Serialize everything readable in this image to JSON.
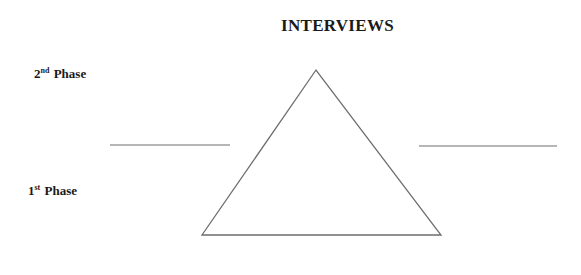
{
  "title": "INTERVIEWS",
  "phases": [
    {
      "number": "2",
      "suffix": "nd",
      "label": "Phase",
      "position": "upper"
    },
    {
      "number": "1",
      "suffix": "st",
      "label": "Phase",
      "position": "lower"
    }
  ],
  "shapes": {
    "triangle": {
      "apex": [
        316,
        70
      ],
      "base_left": [
        202,
        235
      ],
      "base_right": [
        441,
        235
      ],
      "stroke": "#6e6e6e"
    },
    "left_divider": {
      "x1": 110,
      "x2": 230,
      "y": 145,
      "stroke": "#6e6e6e"
    },
    "right_divider": {
      "x1": 419,
      "x2": 557,
      "y": 146,
      "stroke": "#6e6e6e"
    }
  }
}
